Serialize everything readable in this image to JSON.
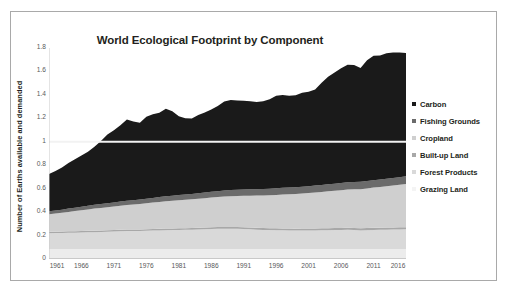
{
  "figure": {
    "border_color": "#a9a9a9",
    "background": "#ffffff"
  },
  "chart_data": {
    "type": "area",
    "stacked": true,
    "title": "World Ecological Footprint by Component",
    "xlabel": "",
    "ylabel": "Number of Earths available and demanded",
    "xlim": [
      1961,
      2016
    ],
    "ylim": [
      0,
      1.8
    ],
    "grid": false,
    "legend_position": "right",
    "y_ticks": [
      "0",
      "0.2",
      "0.4",
      "0.6",
      "0.8",
      "1",
      "1.2",
      "1.4",
      "1.6",
      "1.8"
    ],
    "y_tick_values": [
      0,
      0.2,
      0.4,
      0.6,
      0.8,
      1.0,
      1.2,
      1.4,
      1.6,
      1.8
    ],
    "x_ticks": [
      "1961",
      "1966",
      "1971",
      "1976",
      "1981",
      "1986",
      "1991",
      "1996",
      "2001",
      "2006",
      "2011",
      "2016"
    ],
    "x_tick_values": [
      1961,
      1966,
      1971,
      1976,
      1981,
      1986,
      1991,
      1996,
      2001,
      2006,
      2011,
      2016
    ],
    "annotations": [
      {
        "name": "one-earth-line",
        "type": "hline",
        "y": 1.0,
        "color": "#f2f2f2",
        "label": ""
      }
    ],
    "x": [
      1961,
      1962,
      1963,
      1964,
      1965,
      1966,
      1967,
      1968,
      1969,
      1970,
      1971,
      1972,
      1973,
      1974,
      1975,
      1976,
      1977,
      1978,
      1979,
      1980,
      1981,
      1982,
      1983,
      1984,
      1985,
      1986,
      1987,
      1988,
      1989,
      1990,
      1991,
      1992,
      1993,
      1994,
      1995,
      1996,
      1997,
      1998,
      1999,
      2000,
      2001,
      2002,
      2003,
      2004,
      2005,
      2006,
      2007,
      2008,
      2009,
      2010,
      2011,
      2012,
      2013,
      2014,
      2015,
      2016
    ],
    "series": [
      {
        "name": "Grazing Land",
        "color": "#ececec",
        "stack_order": 1,
        "values": [
          0.085,
          0.085,
          0.085,
          0.086,
          0.086,
          0.086,
          0.086,
          0.086,
          0.086,
          0.086,
          0.086,
          0.086,
          0.086,
          0.086,
          0.086,
          0.086,
          0.086,
          0.086,
          0.086,
          0.086,
          0.086,
          0.086,
          0.086,
          0.086,
          0.086,
          0.086,
          0.086,
          0.086,
          0.086,
          0.086,
          0.086,
          0.086,
          0.086,
          0.086,
          0.086,
          0.086,
          0.086,
          0.086,
          0.086,
          0.086,
          0.086,
          0.086,
          0.086,
          0.086,
          0.086,
          0.086,
          0.086,
          0.086,
          0.086,
          0.086,
          0.086,
          0.086,
          0.086,
          0.086,
          0.086,
          0.086
        ]
      },
      {
        "name": "Forest Products",
        "color": "#d9d9d9",
        "stack_order": 2,
        "values": [
          0.135,
          0.136,
          0.137,
          0.138,
          0.139,
          0.14,
          0.142,
          0.143,
          0.145,
          0.146,
          0.148,
          0.15,
          0.152,
          0.152,
          0.153,
          0.155,
          0.157,
          0.158,
          0.16,
          0.161,
          0.162,
          0.163,
          0.164,
          0.166,
          0.168,
          0.17,
          0.171,
          0.172,
          0.172,
          0.171,
          0.169,
          0.167,
          0.164,
          0.162,
          0.161,
          0.16,
          0.159,
          0.158,
          0.157,
          0.157,
          0.157,
          0.158,
          0.159,
          0.16,
          0.161,
          0.162,
          0.163,
          0.162,
          0.158,
          0.16,
          0.162,
          0.163,
          0.164,
          0.165,
          0.166,
          0.167
        ]
      },
      {
        "name": "Built-up Land",
        "color": "#a8a8a8",
        "stack_order": 3,
        "values": [
          0.012,
          0.012,
          0.012,
          0.012,
          0.012,
          0.012,
          0.012,
          0.013,
          0.013,
          0.013,
          0.013,
          0.013,
          0.013,
          0.013,
          0.013,
          0.013,
          0.013,
          0.014,
          0.014,
          0.014,
          0.014,
          0.014,
          0.014,
          0.014,
          0.014,
          0.015,
          0.015,
          0.015,
          0.015,
          0.015,
          0.015,
          0.015,
          0.016,
          0.016,
          0.016,
          0.016,
          0.016,
          0.016,
          0.016,
          0.017,
          0.017,
          0.017,
          0.017,
          0.017,
          0.017,
          0.017,
          0.017,
          0.017,
          0.018,
          0.018,
          0.018,
          0.018,
          0.018,
          0.018,
          0.018,
          0.018
        ]
      },
      {
        "name": "Cropland",
        "color": "#cfcfcf",
        "stack_order": 4,
        "values": [
          0.15,
          0.155,
          0.16,
          0.166,
          0.172,
          0.178,
          0.183,
          0.188,
          0.192,
          0.196,
          0.2,
          0.205,
          0.209,
          0.213,
          0.217,
          0.221,
          0.225,
          0.229,
          0.233,
          0.236,
          0.239,
          0.242,
          0.245,
          0.248,
          0.251,
          0.254,
          0.257,
          0.26,
          0.263,
          0.266,
          0.269,
          0.272,
          0.275,
          0.278,
          0.281,
          0.285,
          0.289,
          0.292,
          0.296,
          0.299,
          0.302,
          0.306,
          0.31,
          0.314,
          0.318,
          0.322,
          0.326,
          0.33,
          0.334,
          0.338,
          0.343,
          0.348,
          0.353,
          0.358,
          0.363,
          0.368
        ]
      },
      {
        "name": "Fishing Grounds",
        "color": "#6b6b6b",
        "stack_order": 5,
        "values": [
          0.025,
          0.026,
          0.027,
          0.028,
          0.029,
          0.03,
          0.031,
          0.032,
          0.033,
          0.034,
          0.035,
          0.036,
          0.036,
          0.037,
          0.038,
          0.039,
          0.04,
          0.041,
          0.042,
          0.043,
          0.044,
          0.045,
          0.046,
          0.047,
          0.048,
          0.049,
          0.05,
          0.051,
          0.052,
          0.053,
          0.054,
          0.054,
          0.055,
          0.055,
          0.056,
          0.056,
          0.057,
          0.057,
          0.058,
          0.058,
          0.059,
          0.059,
          0.06,
          0.06,
          0.061,
          0.061,
          0.062,
          0.062,
          0.062,
          0.063,
          0.063,
          0.064,
          0.064,
          0.065,
          0.065,
          0.066
        ]
      },
      {
        "name": "Carbon",
        "color": "#1a1a1a",
        "stack_order": 6,
        "values": [
          0.318,
          0.336,
          0.359,
          0.389,
          0.412,
          0.437,
          0.461,
          0.496,
          0.537,
          0.588,
          0.617,
          0.651,
          0.694,
          0.673,
          0.656,
          0.699,
          0.714,
          0.72,
          0.747,
          0.72,
          0.672,
          0.65,
          0.643,
          0.667,
          0.683,
          0.702,
          0.726,
          0.759,
          0.769,
          0.762,
          0.756,
          0.752,
          0.744,
          0.749,
          0.762,
          0.789,
          0.793,
          0.784,
          0.783,
          0.801,
          0.806,
          0.82,
          0.871,
          0.918,
          0.947,
          0.979,
          1.003,
          0.999,
          0.971,
          1.031,
          1.062,
          1.057,
          1.07,
          1.07,
          1.063,
          1.053
        ]
      }
    ],
    "totals": [
      0.725,
      0.75,
      0.78,
      0.819,
      0.85,
      0.883,
      0.915,
      0.958,
      1.006,
      1.063,
      1.099,
      1.141,
      1.19,
      1.174,
      1.163,
      1.213,
      1.235,
      1.248,
      1.282,
      1.259,
      1.217,
      1.2,
      1.198,
      1.228,
      1.25,
      1.276,
      1.305,
      1.343,
      1.357,
      1.353,
      1.349,
      1.346,
      1.34,
      1.346,
      1.362,
      1.392,
      1.4,
      1.395,
      1.396,
      1.418,
      1.427,
      1.446,
      1.503,
      1.555,
      1.59,
      1.627,
      1.657,
      1.656,
      1.629,
      1.696,
      1.734,
      1.736,
      1.755,
      1.762,
      1.761,
      1.758
    ]
  },
  "legend": {
    "items": [
      {
        "label": "Carbon",
        "color": "#1a1a1a"
      },
      {
        "label": "Fishing Grounds",
        "color": "#6b6b6b"
      },
      {
        "label": "Cropland",
        "color": "#cfcfcf"
      },
      {
        "label": "Built-up Land",
        "color": "#a8a8a8"
      },
      {
        "label": "Forest Products",
        "color": "#d9d9d9"
      },
      {
        "label": "Grazing Land",
        "color": "#f4f4f4"
      }
    ]
  }
}
